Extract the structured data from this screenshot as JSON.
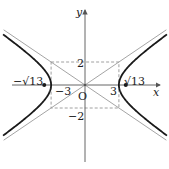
{
  "diagram": {
    "a": 3,
    "b": 2,
    "focus": 3.605551,
    "xrange": [
      -7.5,
      7.5
    ],
    "yrange": [
      -7.5,
      7.5
    ],
    "labels": {
      "x_axis": "x",
      "y_axis": "y",
      "origin": "O",
      "pos_vertex": "3",
      "neg_vertex": "−3",
      "pos_b": "2",
      "neg_b": "−2",
      "pos_focus": "√13",
      "neg_focus": "−√13"
    },
    "colors": {
      "curve": "#1a1a1a",
      "asymptote": "#9a9a9a",
      "axis": "#555555",
      "dashed": "#888888"
    }
  }
}
